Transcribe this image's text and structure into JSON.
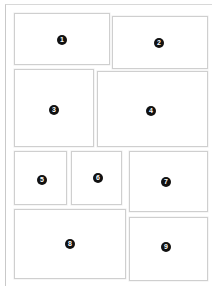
{
  "page": {
    "background_color": "#ffffff",
    "sheet_border_color": "#c9c9c9",
    "box_border_color": "#cfcfcf",
    "badge_background_color": "#111111",
    "badge_text_color": "#ffffff"
  },
  "boxes": [
    {
      "label": "1",
      "x": 14,
      "y": 13,
      "w": 96,
      "h": 52,
      "badge_x": 62,
      "badge_y": 40
    },
    {
      "label": "2",
      "x": 112,
      "y": 16,
      "w": 96,
      "h": 53,
      "badge_x": 159,
      "badge_y": 43
    },
    {
      "label": "3",
      "x": 14,
      "y": 69,
      "w": 80,
      "h": 78,
      "badge_x": 54,
      "badge_y": 110
    },
    {
      "label": "4",
      "x": 97,
      "y": 71,
      "w": 111,
      "h": 76,
      "badge_x": 151,
      "badge_y": 111
    },
    {
      "label": "5",
      "x": 14,
      "y": 151,
      "w": 53,
      "h": 54,
      "badge_x": 42,
      "badge_y": 180
    },
    {
      "label": "6",
      "x": 71,
      "y": 151,
      "w": 51,
      "h": 54,
      "badge_x": 98,
      "badge_y": 178
    },
    {
      "label": "7",
      "x": 129,
      "y": 151,
      "w": 79,
      "h": 61,
      "badge_x": 166,
      "badge_y": 182
    },
    {
      "label": "8",
      "x": 14,
      "y": 209,
      "w": 112,
      "h": 70,
      "badge_x": 70,
      "badge_y": 244
    },
    {
      "label": "9",
      "x": 129,
      "y": 217,
      "w": 79,
      "h": 64,
      "badge_x": 166,
      "badge_y": 247
    }
  ]
}
